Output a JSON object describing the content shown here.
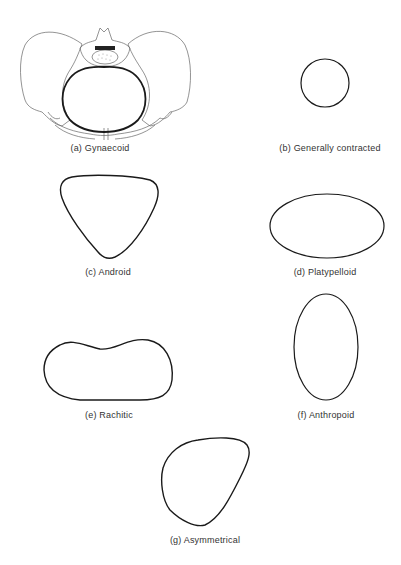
{
  "figure": {
    "panels": [
      {
        "id": "a",
        "label": "(a) Gynaecoid",
        "shape": "round inlet within pelvis drawing"
      },
      {
        "id": "b",
        "label": "(b) Generally contracted",
        "shape": "small circle"
      },
      {
        "id": "c",
        "label": "(c) Android",
        "shape": "heart/triangular"
      },
      {
        "id": "d",
        "label": "(d) Platypelloid",
        "shape": "transverse oval"
      },
      {
        "id": "e",
        "label": "(e) Rachitic",
        "shape": "kidney"
      },
      {
        "id": "f",
        "label": "(f) Anthropoid",
        "shape": "longitudinal oval"
      },
      {
        "id": "g",
        "label": "(g) Asymmetrical",
        "shape": "irregular"
      }
    ]
  },
  "colors": {
    "outline": "#1a1a1a",
    "sketch": "#555555",
    "label": "#333333",
    "background": "#ffffff"
  }
}
